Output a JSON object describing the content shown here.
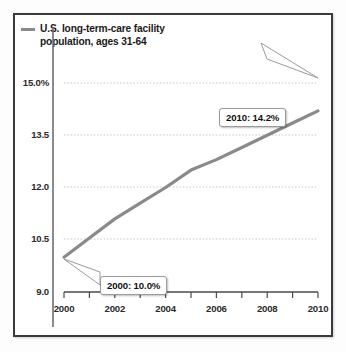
{
  "legend": {
    "label": "U.S. long-term-care facility\npopulation, ages 31-64",
    "swatch_name": "line-swatch",
    "color": "#8a8a8a"
  },
  "axes": {
    "y_ticks": [
      "15.0%",
      "13.5",
      "12.0",
      "10.5",
      "9.0"
    ],
    "x_ticks": [
      "2000",
      "2002",
      "2004",
      "2006",
      "2008",
      "2010"
    ]
  },
  "callouts": {
    "end": "2010: 14.2%",
    "start": "2000: 10.0%"
  },
  "chart_data": {
    "type": "line",
    "title": "",
    "subtitle": "",
    "xlabel": "",
    "ylabel": "",
    "xlim": [
      2000,
      2010
    ],
    "ylim": [
      9.0,
      15.0
    ],
    "grid": true,
    "gridlines_y": [
      9.0,
      10.5,
      12.0,
      13.5,
      15.0
    ],
    "legend_position": "top-left",
    "x_tick_labels": [
      "2000",
      "2002",
      "2004",
      "2006",
      "2008",
      "2010"
    ],
    "x_minor_ticks": [
      2000,
      2001,
      2002,
      2003,
      2004,
      2005,
      2006,
      2007,
      2008,
      2009,
      2010
    ],
    "y_tick_labels": [
      "9.0",
      "10.5",
      "12.0",
      "13.5",
      "15.0%"
    ],
    "series": [
      {
        "name": "U.S. long-term-care facility population, ages 31-64",
        "color": "#8a8a8a",
        "x": [
          2000,
          2001,
          2002,
          2003,
          2004,
          2005,
          2006,
          2007,
          2008,
          2009,
          2010
        ],
        "values": [
          10.0,
          10.55,
          11.1,
          11.55,
          12.0,
          12.5,
          12.8,
          13.15,
          13.5,
          13.85,
          14.2
        ]
      }
    ],
    "annotations": [
      {
        "label": "2000: 10.0%",
        "x": 2000,
        "y": 10.0
      },
      {
        "label": "2010: 14.2%",
        "x": 2010,
        "y": 14.2
      }
    ]
  }
}
